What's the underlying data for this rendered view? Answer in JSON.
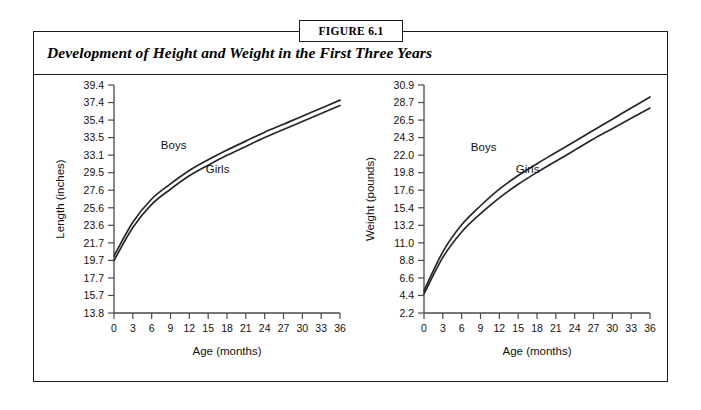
{
  "figure": {
    "tag": "FIGURE 6.1",
    "title": "Development of Height and Weight in the First Three Years"
  },
  "charts": [
    {
      "id": "length",
      "ylabel": "Length (inches)",
      "xlabel": "Age (months)",
      "boys_label": "Boys",
      "girls_label": "Girls"
    },
    {
      "id": "weight",
      "ylabel": "Weight (pounds)",
      "xlabel": "Age (months)",
      "boys_label": "Boys",
      "girls_label": "Girls"
    }
  ],
  "chart_data": [
    {
      "type": "line",
      "id": "length-chart",
      "title": "Development of Height and Weight in the First Three Years",
      "xlabel": "Age (months)",
      "ylabel": "Length (inches)",
      "xlim": [
        0,
        36
      ],
      "ylim": [
        13.8,
        39.4
      ],
      "xticks": [
        0,
        3,
        6,
        9,
        12,
        15,
        18,
        21,
        24,
        27,
        30,
        33,
        36
      ],
      "xtick_labels": [
        "0",
        "3",
        "6",
        "9",
        "12",
        "15",
        "18",
        "21",
        "24",
        "27",
        "30",
        "33",
        "36"
      ],
      "yticks": [
        13.8,
        15.7,
        17.7,
        19.7,
        21.7,
        23.6,
        25.6,
        27.6,
        29.5,
        33.1,
        33.5,
        35.4,
        37.4,
        39.4
      ],
      "ytick_labels": [
        "13.8",
        "15.7",
        "17.7",
        "19.7",
        "21.7",
        "23.6",
        "25.6",
        "27.6",
        "29.5",
        "33.1",
        "33.5",
        "35.4",
        "37.4",
        "39.4"
      ],
      "grid": false,
      "legend": "inline-curve-labels",
      "x": [
        0,
        3,
        6,
        9,
        12,
        15,
        18,
        21,
        24,
        27,
        30,
        33,
        36
      ],
      "series": [
        {
          "name": "Boys",
          "values": [
            20.2,
            24.0,
            26.6,
            28.3,
            29.8,
            31.0,
            32.1,
            33.1,
            34.1,
            35.0,
            35.9,
            36.8,
            37.7
          ]
        },
        {
          "name": "Girls",
          "values": [
            19.7,
            23.4,
            26.0,
            27.7,
            29.2,
            30.4,
            31.5,
            32.5,
            33.5,
            34.4,
            35.3,
            36.2,
            37.1
          ]
        }
      ],
      "annotations": [
        {
          "text": "Boys",
          "x": 9.5,
          "y": 32.2
        },
        {
          "text": "Girls",
          "x": 16.5,
          "y": 29.5
        }
      ]
    },
    {
      "type": "line",
      "id": "weight-chart",
      "title": "Development of Height and Weight in the First Three Years",
      "xlabel": "Age (months)",
      "ylabel": "Weight (pounds)",
      "xlim": [
        0,
        36
      ],
      "ylim": [
        2.2,
        30.9
      ],
      "xticks": [
        0,
        3,
        6,
        9,
        12,
        15,
        18,
        21,
        24,
        27,
        30,
        33,
        36
      ],
      "xtick_labels": [
        "0",
        "3",
        "6",
        "9",
        "12",
        "15",
        "18",
        "21",
        "24",
        "27",
        "30",
        "33",
        "36"
      ],
      "yticks": [
        2.2,
        4.4,
        6.6,
        8.8,
        11.0,
        13.2,
        15.4,
        17.6,
        19.8,
        22.0,
        24.3,
        26.5,
        28.7,
        30.9
      ],
      "ytick_labels": [
        "2.2",
        "4.4",
        "6.6",
        "8.8",
        "11.0",
        "13.2",
        "15.4",
        "17.6",
        "19.8",
        "22.0",
        "24.3",
        "26.5",
        "28.7",
        "30.9"
      ],
      "grid": false,
      "legend": "inline-curve-labels",
      "x": [
        0,
        3,
        6,
        9,
        12,
        15,
        18,
        21,
        24,
        27,
        30,
        33,
        36
      ],
      "series": [
        {
          "name": "Boys",
          "values": [
            5.0,
            9.9,
            13.3,
            15.7,
            17.8,
            19.5,
            21.0,
            22.4,
            23.8,
            25.2,
            26.6,
            28.0,
            29.4
          ]
        },
        {
          "name": "Girls",
          "values": [
            4.6,
            9.2,
            12.4,
            14.7,
            16.7,
            18.4,
            19.9,
            21.3,
            22.7,
            24.1,
            25.4,
            26.7,
            28.0
          ]
        }
      ],
      "annotations": [
        {
          "text": "Boys",
          "x": 9.5,
          "y": 22.6
        },
        {
          "text": "Girls",
          "x": 16.5,
          "y": 19.8
        }
      ]
    }
  ]
}
